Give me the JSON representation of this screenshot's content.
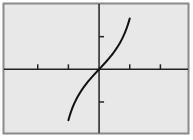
{
  "chart_data": {
    "type": "line",
    "title": "",
    "xlabel": "",
    "ylabel": "",
    "function": "y = tan(x)",
    "x_domain": [
      -1,
      1
    ],
    "xlim": [
      -3.1,
      2.9
    ],
    "ylim": [
      -1.95,
      2.0
    ],
    "x_ticks": [
      -2,
      -1,
      1,
      2
    ],
    "y_ticks": [
      -1,
      1
    ],
    "tick_labels_shown": false,
    "grid": false,
    "legend": null,
    "series": [
      {
        "name": "curve",
        "x": [
          -1,
          -0.8,
          -0.6,
          -0.4,
          -0.2,
          0,
          0.2,
          0.4,
          0.6,
          0.8,
          1
        ],
        "y": [
          -1.557,
          -1.03,
          -0.684,
          -0.423,
          -0.203,
          0,
          0.203,
          0.423,
          0.684,
          1.03,
          1.557
        ]
      }
    ],
    "colors": {
      "background": "#e8e8e8",
      "frame": "#8a8a8a",
      "axes": "#222222",
      "curve": "#111111"
    }
  }
}
